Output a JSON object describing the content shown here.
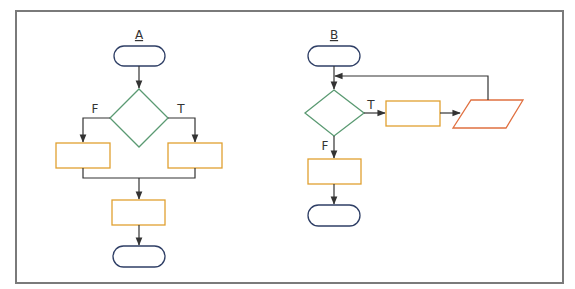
{
  "colors": {
    "frame": "#777777",
    "terminal": "#2f3f66",
    "decision": "#4a9a6a",
    "process": "#e0a030",
    "io": "#e07040",
    "connector": "#333333"
  },
  "flowcharts": [
    {
      "id": "A",
      "title": "A",
      "branch_labels": {
        "false": "F",
        "true": "T"
      },
      "shapes": [
        "terminal-start",
        "decision",
        "process-false",
        "process-true",
        "process-merge",
        "terminal-end"
      ]
    },
    {
      "id": "B",
      "title": "B",
      "branch_labels": {
        "false": "F",
        "true": "T"
      },
      "shapes": [
        "terminal-start",
        "decision",
        "process-loop-body",
        "io-parallelogram",
        "process-exit",
        "terminal-end"
      ]
    }
  ]
}
